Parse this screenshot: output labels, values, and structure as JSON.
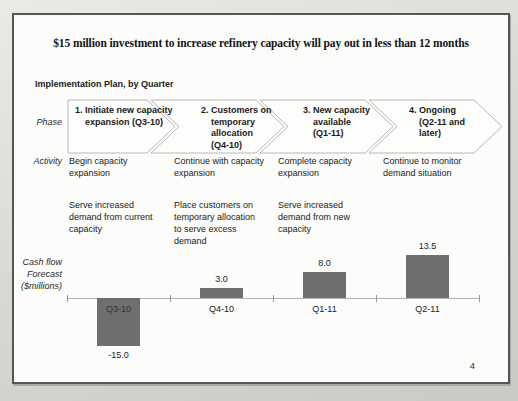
{
  "slide": {
    "title": "$15 million investment to increase refinery capacity will pay out in less than 12 months",
    "subtitle": "Implementation Plan, by Quarter",
    "page_number": "4"
  },
  "row_labels": {
    "phase": "Phase",
    "activity": "Activity",
    "cashflow_line1": "Cash flow",
    "cashflow_line2": "Forecast",
    "cashflow_line3": "($millions)"
  },
  "phases": [
    {
      "label": "1. Initiate new capacity\nexpansion (Q3-10)"
    },
    {
      "label": "2. Customers on\ntemporary\nallocation\n(Q4-10)"
    },
    {
      "label": "3. New capacity\navailable\n(Q1-11)"
    },
    {
      "label": "4. Ongoing\n(Q2-11 and\nlater)"
    }
  ],
  "activities": [
    {
      "primary": "Begin capacity\nexpansion",
      "secondary": "Serve increased\ndemand from current\ncapacity"
    },
    {
      "primary": "Continue with capacity\nexpansion",
      "secondary": "Place customers on\ntemporary allocation\nto serve excess\ndemand"
    },
    {
      "primary": "Complete capacity\nexpansion",
      "secondary": "Serve increased\ndemand from new\ncapacity"
    },
    {
      "primary": "Continue to monitor\ndemand situation",
      "secondary": ""
    }
  ],
  "chart_data": {
    "type": "bar",
    "title": "Cash flow Forecast ($millions)",
    "categories": [
      "Q3-10",
      "Q4-10",
      "Q1-11",
      "Q2-11"
    ],
    "values": [
      -15.0,
      3.0,
      8.0,
      13.5
    ],
    "value_labels": [
      "-15.0",
      "3.0",
      "8.0",
      "13.5"
    ],
    "xlabel": "Quarter",
    "ylabel": "Cash flow ($millions)",
    "ylim": [
      -16,
      15
    ],
    "grid": "off",
    "legend": "none",
    "bar_color": "#6f6f6f",
    "axis_color": "#b2b2b0"
  },
  "colors": {
    "slide_background": "#fcfcfa",
    "border": "#565658",
    "arrow_outline": "#b8b8b6",
    "text": "#1c1c1c"
  }
}
